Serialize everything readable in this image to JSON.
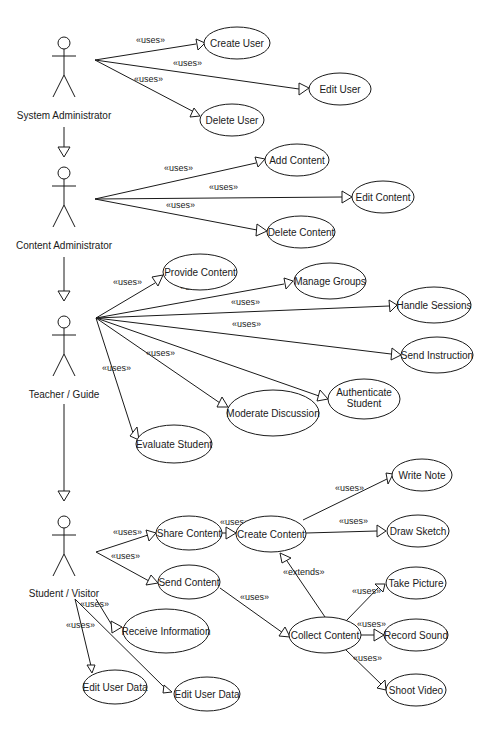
{
  "diagram": {
    "type": "UML use case diagram",
    "actors": [
      {
        "id": "sysadmin",
        "label": "System Administrator",
        "x": 60,
        "y": 40
      },
      {
        "id": "contentadmin",
        "label": "Content Administrator",
        "x": 64,
        "y": 170
      },
      {
        "id": "teacher",
        "label": "Teacher / Guide",
        "x": 64,
        "y": 320
      },
      {
        "id": "student",
        "label": "Student / Visitor",
        "x": 64,
        "y": 520
      }
    ],
    "generalizations": [
      {
        "from": "contentadmin",
        "to": "sysadmin"
      },
      {
        "from": "teacher",
        "to": "contentadmin"
      },
      {
        "from": "student",
        "to": "teacher"
      }
    ],
    "use_cases": [
      {
        "id": "create_user",
        "label": "Create User",
        "cx": 237,
        "cy": 43,
        "rx": 33,
        "ry": 16
      },
      {
        "id": "edit_user",
        "label": "Edit User",
        "cx": 339,
        "cy": 89,
        "rx": 31,
        "ry": 16
      },
      {
        "id": "delete_user",
        "label": "Delete User",
        "cx": 231,
        "cy": 120,
        "rx": 32,
        "ry": 16
      },
      {
        "id": "add_content",
        "label": "Add Content",
        "cx": 297,
        "cy": 160,
        "rx": 32,
        "ry": 16
      },
      {
        "id": "edit_content",
        "label": "Edit Content",
        "cx": 383,
        "cy": 197,
        "rx": 31,
        "ry": 16
      },
      {
        "id": "delete_content",
        "label": "Delete Content",
        "cx": 301,
        "cy": 232,
        "rx": 34,
        "ry": 16
      },
      {
        "id": "provide_content",
        "label": "Provide Content",
        "cx": 200,
        "cy": 272,
        "rx": 37,
        "ry": 18
      },
      {
        "id": "manage_groups",
        "label": "Manage Groups",
        "cx": 329,
        "cy": 281,
        "rx": 36,
        "ry": 18
      },
      {
        "id": "handle_sessions",
        "label": "Handle Sessions",
        "cx": 434,
        "cy": 305,
        "rx": 37,
        "ry": 18
      },
      {
        "id": "send_instruction",
        "label": "Send Instruction",
        "cx": 437,
        "cy": 355,
        "rx": 36,
        "ry": 18
      },
      {
        "id": "authenticate_student",
        "label": "Authenticate\nStudent",
        "cx": 363,
        "cy": 399,
        "rx": 36,
        "ry": 20
      },
      {
        "id": "moderate_discussion",
        "label": "Moderate Discussion",
        "cx": 273,
        "cy": 413,
        "rx": 46,
        "ry": 23
      },
      {
        "id": "evaluate_student",
        "label": "Evaluate Student",
        "cx": 173,
        "cy": 444,
        "rx": 38,
        "ry": 19
      },
      {
        "id": "write_note",
        "label": "Write Note",
        "cx": 421,
        "cy": 475,
        "rx": 30,
        "ry": 16
      },
      {
        "id": "share_content",
        "label": "Share Content",
        "cx": 189,
        "cy": 533,
        "rx": 33,
        "ry": 17
      },
      {
        "id": "create_content",
        "label": "Create Content",
        "cx": 271,
        "cy": 534,
        "rx": 35,
        "ry": 18
      },
      {
        "id": "draw_sketch",
        "label": "Draw Sketch",
        "cx": 418,
        "cy": 531,
        "rx": 31,
        "ry": 16
      },
      {
        "id": "send_content",
        "label": "Send Content",
        "cx": 189,
        "cy": 582,
        "rx": 31,
        "ry": 17
      },
      {
        "id": "take_picture",
        "label": "Take Picture",
        "cx": 415,
        "cy": 583,
        "rx": 30,
        "ry": 16
      },
      {
        "id": "receive_information",
        "label": "Receive Information",
        "cx": 165,
        "cy": 631,
        "rx": 43,
        "ry": 22
      },
      {
        "id": "collect_content",
        "label": "Collect Content",
        "cx": 325,
        "cy": 635,
        "rx": 36,
        "ry": 18
      },
      {
        "id": "record_sound",
        "label": "Record Sound",
        "cx": 416,
        "cy": 635,
        "rx": 32,
        "ry": 16
      },
      {
        "id": "edit_user_data_1",
        "label": "Edit User Data",
        "cx": 115,
        "cy": 687,
        "rx": 32,
        "ry": 17
      },
      {
        "id": "edit_user_data_2",
        "label": "Edit User Data",
        "cx": 207,
        "cy": 694,
        "rx": 33,
        "ry": 17
      },
      {
        "id": "shoot_video",
        "label": "Shoot Video",
        "cx": 416,
        "cy": 690,
        "rx": 30,
        "ry": 16
      }
    ],
    "stereotypes": {
      "uses": "«uses»",
      "extends": "«extends»"
    },
    "associations": [
      {
        "from": "sysadmin",
        "to": "create_user",
        "stereotype": "uses"
      },
      {
        "from": "sysadmin",
        "to": "edit_user",
        "stereotype": "uses"
      },
      {
        "from": "sysadmin",
        "to": "delete_user",
        "stereotype": "uses"
      },
      {
        "from": "contentadmin",
        "to": "add_content",
        "stereotype": "uses"
      },
      {
        "from": "contentadmin",
        "to": "edit_content",
        "stereotype": "uses"
      },
      {
        "from": "contentadmin",
        "to": "delete_content",
        "stereotype": "uses"
      },
      {
        "from": "teacher",
        "to": "provide_content",
        "stereotype": "uses"
      },
      {
        "from": "teacher",
        "to": "manage_groups",
        "stereotype": "uses"
      },
      {
        "from": "teacher",
        "to": "handle_sessions",
        "stereotype": "uses"
      },
      {
        "from": "teacher",
        "to": "send_instruction",
        "stereotype": "uses"
      },
      {
        "from": "teacher",
        "to": "authenticate_student",
        "stereotype": "uses"
      },
      {
        "from": "teacher",
        "to": "moderate_discussion",
        "stereotype": "uses"
      },
      {
        "from": "teacher",
        "to": "evaluate_student",
        "stereotype": "uses"
      },
      {
        "from": "student",
        "to": "share_content",
        "stereotype": "uses"
      },
      {
        "from": "student",
        "to": "send_content",
        "stereotype": "uses"
      },
      {
        "from": "share_content",
        "to": "create_content",
        "stereotype": "uses"
      },
      {
        "from": "create_content",
        "to": "write_note",
        "stereotype": "uses"
      },
      {
        "from": "create_content",
        "to": "draw_sketch",
        "stereotype": "uses"
      },
      {
        "from": "send_content",
        "to": "collect_content",
        "stereotype": "uses"
      },
      {
        "from": "collect_content",
        "to": "create_content",
        "stereotype": "extends"
      },
      {
        "from": "collect_content",
        "to": "take_picture",
        "stereotype": "uses"
      },
      {
        "from": "collect_content",
        "to": "record_sound",
        "stereotype": "uses"
      },
      {
        "from": "collect_content",
        "to": "shoot_video",
        "stereotype": "uses"
      },
      {
        "from": "student",
        "to": "receive_information",
        "stereotype": "uses"
      },
      {
        "from": "student",
        "to": "edit_user_data_1",
        "stereotype": "uses"
      },
      {
        "from": "student",
        "to": "edit_user_data_2",
        "stereotype": ""
      }
    ]
  },
  "labels": {
    "actor_sysadmin": "System Administrator",
    "actor_contentadmin": "Content Administrator",
    "actor_teacher": "Teacher / Guide",
    "actor_student": "Student / Visitor",
    "uc_create_user": "Create User",
    "uc_edit_user": "Edit User",
    "uc_delete_user": "Delete User",
    "uc_add_content": "Add Content",
    "uc_edit_content": "Edit Content",
    "uc_delete_content": "Delete Content",
    "uc_provide_content": "Provide Content",
    "uc_manage_groups": "Manage Groups",
    "uc_handle_sessions": "Handle Sessions",
    "uc_send_instruction": "Send Instruction",
    "uc_authenticate_1": "Authenticate",
    "uc_authenticate_2": "Student",
    "uc_moderate_discussion": "Moderate Discussion",
    "uc_evaluate_student": "Evaluate Student",
    "uc_write_note": "Write Note",
    "uc_share_content": "Share Content",
    "uc_create_content": "Create Content",
    "uc_draw_sketch": "Draw Sketch",
    "uc_send_content": "Send Content",
    "uc_take_picture": "Take Picture",
    "uc_receive_information": "Receive Information",
    "uc_collect_content": "Collect Content",
    "uc_record_sound": "Record Sound",
    "uc_edit_user_data_1": "Edit User Data",
    "uc_edit_user_data_2": "Edit User Data",
    "uc_shoot_video": "Shoot Video",
    "uses": "«uses»",
    "extends": "«extends»"
  }
}
